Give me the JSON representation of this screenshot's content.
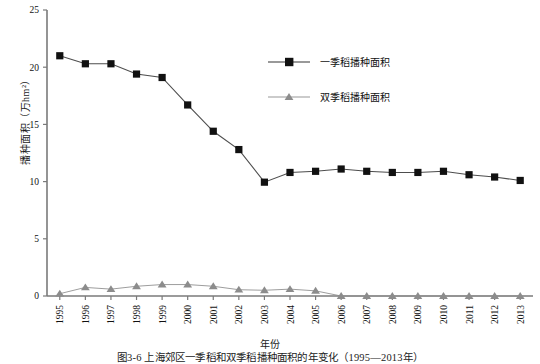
{
  "figure": {
    "caption": "图3-6  上海郊区一季稻和双季稻播种面积的年变化（1995—2013年）",
    "x_axis_title": "年份",
    "y_axis_title": "播种面积（万hm²）"
  },
  "chart_data": {
    "type": "line",
    "title": "",
    "xlabel": "年份",
    "ylabel": "播种面积（万hm²）",
    "grid": false,
    "legend_position": "top-right",
    "ylim": [
      0,
      25
    ],
    "yticks": [
      0,
      5,
      10,
      15,
      20,
      25
    ],
    "categories": [
      "1995",
      "1996",
      "1997",
      "1998",
      "1999",
      "2000",
      "2001",
      "2002",
      "2003",
      "2004",
      "2005",
      "2006",
      "2007",
      "2008",
      "2009",
      "2010",
      "2011",
      "2012",
      "2013"
    ],
    "series": [
      {
        "name": "一季稻播种面积",
        "color": "#111111",
        "marker": "square",
        "values": [
          21.0,
          20.3,
          20.3,
          19.4,
          19.1,
          16.7,
          14.4,
          12.8,
          9.95,
          10.8,
          10.9,
          11.1,
          10.9,
          10.8,
          10.8,
          10.9,
          10.6,
          10.4,
          10.1
        ]
      },
      {
        "name": "双季稻播种面积",
        "color": "#8c8c8c",
        "marker": "triangle",
        "values": [
          0.2,
          0.75,
          0.6,
          0.85,
          1.0,
          1.0,
          0.85,
          0.55,
          0.5,
          0.6,
          0.45,
          0.0,
          0.0,
          0.0,
          0.0,
          0.0,
          0.0,
          0.0,
          0.0
        ]
      }
    ]
  },
  "legend": {
    "items": [
      {
        "label": "一季稻播种面积",
        "color": "#111111",
        "marker": "square"
      },
      {
        "label": "双季稻播种面积",
        "color": "#8c8c8c",
        "marker": "triangle"
      }
    ]
  }
}
